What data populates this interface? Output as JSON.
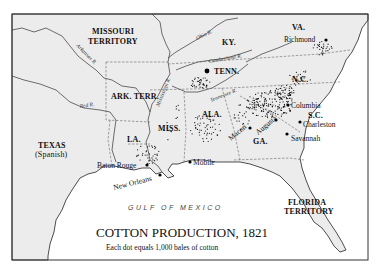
{
  "map": {
    "title": "COTTON PRODUCTION, 1821",
    "subtitle": "Each dot equals 1,000 bales of cotton",
    "legend": {
      "dot_value_bales": 1000
    },
    "water_body": "GULF OF MEXICO",
    "regions": [
      {
        "id": "missouri",
        "line1": "MISSOURI",
        "line2": "TERRITORY"
      },
      {
        "id": "ark",
        "line1": "ARK. TERR."
      },
      {
        "id": "texas",
        "line1": "TEXAS",
        "line2": "(Spanish)"
      },
      {
        "id": "la",
        "line1": "LA."
      },
      {
        "id": "miss",
        "line1": "MISS."
      },
      {
        "id": "ala",
        "line1": "ALA."
      },
      {
        "id": "tenn",
        "line1": "TENN."
      },
      {
        "id": "ky",
        "line1": "KY."
      },
      {
        "id": "va",
        "line1": "VA."
      },
      {
        "id": "nc",
        "line1": "N.C."
      },
      {
        "id": "sc",
        "line1": "S.C."
      },
      {
        "id": "ga",
        "line1": "GA."
      },
      {
        "id": "florida",
        "line1": "FLORIDA",
        "line2": "TERRITORY"
      }
    ],
    "rivers": [
      {
        "id": "arkansas",
        "label": "Arkansas R."
      },
      {
        "id": "red",
        "label": "Red R."
      },
      {
        "id": "mississippi",
        "label": "Mississippi R."
      },
      {
        "id": "ohio",
        "label": "Ohio R."
      },
      {
        "id": "cumberland",
        "label": "Cumberland R."
      },
      {
        "id": "tennessee",
        "label": "Tennessee R."
      }
    ],
    "cities": [
      {
        "id": "richmond",
        "name": "Richmond"
      },
      {
        "id": "columbia",
        "name": "Columbia"
      },
      {
        "id": "charleston",
        "name": "Charleston"
      },
      {
        "id": "savannah",
        "name": "Savannah"
      },
      {
        "id": "augusta",
        "name": "Augusta"
      },
      {
        "id": "macon",
        "name": "Macon"
      },
      {
        "id": "mobile",
        "name": "Mobile"
      },
      {
        "id": "baton-rouge",
        "name": "Baton Rouge"
      },
      {
        "id": "new-orleans",
        "name": "New Orleans"
      }
    ],
    "colors": {
      "land": "#ececec",
      "water": "#ffffff",
      "ink": "#111111"
    }
  }
}
